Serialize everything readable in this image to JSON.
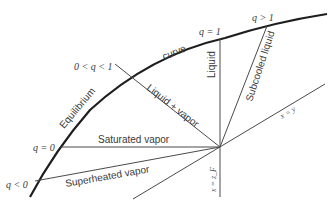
{
  "diagram": {
    "type": "q-line diagram (McCabe-Thiele feed line)",
    "curve_labels": [
      "Equilibrium",
      "curve"
    ],
    "q_labels": {
      "q_less_0": "q < 0",
      "q_eq_0": "q = 0",
      "q_between": "0 < q < 1",
      "q_eq_1": "q = 1",
      "q_greater_1": "q > 1"
    },
    "region_labels": {
      "liquid": "Liquid",
      "subcooled": "Subcooled liquid",
      "liquid_vapor": "Liquid + vapor",
      "saturated_vapor": "Saturated vapor",
      "superheated_vapor": "Superheated vapor"
    },
    "axis_labels": {
      "diagonal": "x = y",
      "feed": "x = z_F"
    },
    "colors": {
      "curve": "#1e1e1e",
      "lines": "#4a4a4a",
      "text": "#3a3a3a"
    }
  }
}
